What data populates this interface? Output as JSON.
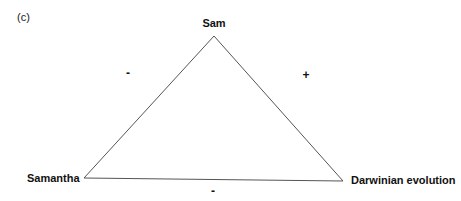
{
  "panel_label": "(c)",
  "nodes": {
    "top": "Sam",
    "left": "Samantha",
    "right": "Darwinian evolution"
  },
  "edges": {
    "top_left": {
      "sign": "-"
    },
    "top_right": {
      "sign": "+"
    },
    "left_right": {
      "sign": "-"
    }
  },
  "colors": {
    "line": "#555555",
    "text": "#111111",
    "background": "#ffffff"
  }
}
